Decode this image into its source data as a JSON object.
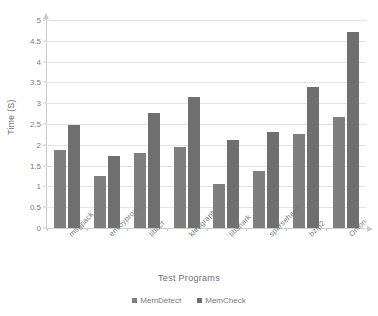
{
  "chart_data": {
    "type": "bar",
    "title": "",
    "xlabel": "Test Programs",
    "ylabel": "Time (S)",
    "ylim": [
      0,
      5
    ],
    "ytick_labels": [
      "5",
      "4.5",
      "4",
      "3.5",
      "3",
      "2.5",
      "2",
      "1.5",
      "1",
      "0.5",
      "0"
    ],
    "ytick_values": [
      5,
      4.5,
      4,
      3.5,
      3,
      2.5,
      2,
      1.5,
      1,
      0.5,
      0
    ],
    "grid": true,
    "legend_position": "bottom",
    "categories": [
      "msgpack",
      "envoyproxy",
      "libdct",
      "kleograph",
      "libsnark",
      "sparsehash",
      "bzip2",
      "Onion"
    ],
    "series": [
      {
        "name": "MemDetect",
        "color": "#7f7f7f",
        "values": [
          1.87,
          1.25,
          1.81,
          1.95,
          1.07,
          1.37,
          2.25,
          2.68
        ]
      },
      {
        "name": "MemCheck",
        "color": "#6f6f6f",
        "values": [
          2.48,
          1.74,
          2.76,
          3.16,
          2.11,
          2.32,
          3.38,
          4.7
        ]
      }
    ]
  }
}
